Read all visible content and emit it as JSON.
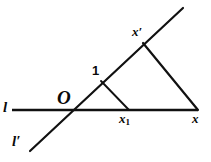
{
  "figure": {
    "background_color": "#ffffff",
    "stroke_color": "#111111",
    "width": 211,
    "height": 162,
    "labels": {
      "line_l": "l",
      "line_l_prime": "l′",
      "origin": "O",
      "unit_point": "1",
      "x_prime_point": "x′",
      "x_sub1_point": "x",
      "x_sub1_subscript": "1",
      "x_point": "x"
    },
    "elements": [
      {
        "name": "line-l",
        "type": "line",
        "label": "l",
        "x1": 12,
        "y1": 110,
        "x2": 198,
        "y2": 110,
        "stroke_width": 2.6
      },
      {
        "name": "line-l-prime",
        "type": "line",
        "label": "l′",
        "x1": 30,
        "y1": 151,
        "x2": 183,
        "y2": 8,
        "stroke_width": 2.2
      },
      {
        "name": "segment-one-to-x1",
        "type": "segment",
        "from": "1",
        "to": "x1",
        "x1": 101,
        "y1": 81,
        "x2": 129,
        "y2": 110,
        "stroke_width": 1.9
      },
      {
        "name": "segment-xprime-to-x",
        "type": "segment",
        "from": "x′",
        "to": "x",
        "x1": 143,
        "y1": 43,
        "x2": 198,
        "y2": 110,
        "stroke_width": 2.2
      }
    ],
    "points": [
      {
        "name": "point-O",
        "label": "O",
        "x": 68,
        "y": 110
      },
      {
        "name": "point-one",
        "label": "1",
        "x": 101,
        "y": 81
      },
      {
        "name": "point-x-prime",
        "label": "x′",
        "x": 143,
        "y": 43
      },
      {
        "name": "point-x1",
        "label": "x1",
        "x": 129,
        "y": 110
      },
      {
        "name": "point-x",
        "label": "x",
        "x": 198,
        "y": 110
      }
    ]
  }
}
